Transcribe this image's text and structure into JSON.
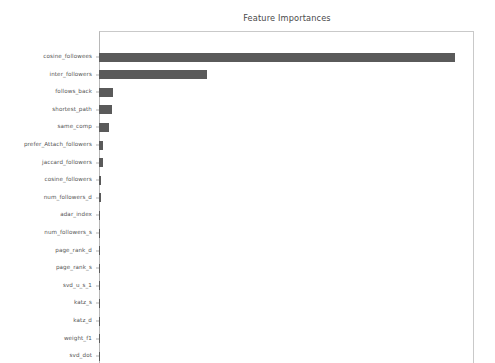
{
  "chart_data": {
    "type": "bar",
    "orientation": "horizontal",
    "title": "Feature Importances",
    "xlabel": "",
    "ylabel": "",
    "grid": false,
    "legend": null,
    "bar_color": "#5a5a5a",
    "background_color": "#ffffff",
    "xlim": [
      0,
      0.4
    ],
    "categories": [
      "cosine_followees",
      "inter_followers",
      "follows_back",
      "shortest_path",
      "same_comp",
      "prefer_Attach_followers",
      "jaccard_followers",
      "cosine_followers",
      "num_followers_d",
      "adar_index",
      "num_followers_s",
      "page_rank_d",
      "page_rank_s",
      "svd_u_s_1",
      "katz_s",
      "katz_d",
      "weight_f1",
      "svd_dot"
    ],
    "values": [
      0.38,
      0.115,
      0.015,
      0.014,
      0.011,
      0.004,
      0.0038,
      0.0025,
      0.0018,
      0.001,
      0.0008,
      0.0007,
      0.0006,
      0.0005,
      0.0004,
      0.0004,
      0.0003,
      0.0002
    ]
  }
}
